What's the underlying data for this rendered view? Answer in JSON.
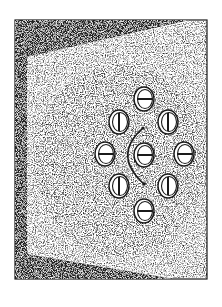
{
  "illustration": {
    "description": "Stippled drawing of a room wall in perspective with nine coin-like discs arranged in a ring and a curved rotation arrow",
    "canvas": {
      "width": 222,
      "height": 307
    },
    "colors": {
      "background": "#ffffff",
      "ink": "#1a1a1a",
      "stipple": "#555555",
      "frame_dark": "#202020"
    },
    "frame": {
      "outer": {
        "x": 15,
        "y": 20,
        "w": 192,
        "h": 259
      },
      "wall_polygon": [
        [
          27,
          57
        ],
        [
          190,
          21
        ],
        [
          207,
          21
        ],
        [
          207,
          278
        ],
        [
          175,
          278
        ],
        [
          27,
          254
        ]
      ],
      "left_strip": {
        "x": 15,
        "w": 12
      },
      "top_band": [
        [
          15,
          20
        ],
        [
          190,
          20
        ],
        [
          27,
          57
        ],
        [
          15,
          57
        ]
      ],
      "bottom_band": [
        [
          15,
          254
        ],
        [
          27,
          254
        ],
        [
          175,
          279
        ],
        [
          15,
          279
        ]
      ]
    },
    "discs": [
      {
        "name": "disc-top",
        "cx": 144,
        "cy": 99,
        "bar": "horizontal"
      },
      {
        "name": "disc-upper-left",
        "cx": 119,
        "cy": 122,
        "bar": "vertical"
      },
      {
        "name": "disc-upper-right",
        "cx": 168,
        "cy": 122,
        "bar": "vertical"
      },
      {
        "name": "disc-middle-left",
        "cx": 105,
        "cy": 154,
        "bar": "horizontal"
      },
      {
        "name": "disc-center",
        "cx": 144,
        "cy": 155,
        "bar": "horizontal"
      },
      {
        "name": "disc-middle-right",
        "cx": 184,
        "cy": 154,
        "bar": "horizontal"
      },
      {
        "name": "disc-lower-left",
        "cx": 119,
        "cy": 186,
        "bar": "vertical"
      },
      {
        "name": "disc-lower-right",
        "cx": 168,
        "cy": 186,
        "bar": "vertical"
      },
      {
        "name": "disc-bottom",
        "cx": 144,
        "cy": 211,
        "bar": "horizontal"
      }
    ],
    "disc_size": {
      "rx": 10,
      "ry": 12
    },
    "arc": {
      "start": [
        143,
        128
      ],
      "control": [
        112,
        155
      ],
      "end": [
        144,
        184
      ]
    }
  }
}
